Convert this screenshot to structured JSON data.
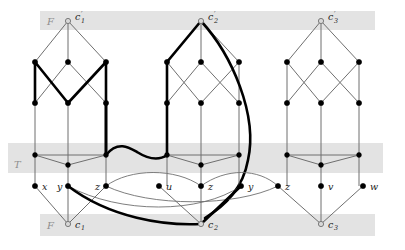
{
  "figure": {
    "width": 405,
    "height": 250,
    "colors": {
      "band": "#e3e3e3",
      "edge": "#6f6f6f",
      "edge_bold": "#000000",
      "node_solid": "#000000",
      "node_open": "#d8d8d8",
      "background": "#ffffff"
    }
  },
  "bands": [
    {
      "name": "F-top",
      "label": "F"
    },
    {
      "name": "T-middle",
      "label": "T"
    },
    {
      "name": "F-bottom",
      "label": "F"
    }
  ],
  "clause_top_nodes": [
    {
      "name": "c1-prime",
      "label": "c",
      "sub": "1",
      "prime": true
    },
    {
      "name": "c2-prime",
      "label": "c",
      "sub": "2",
      "prime": true
    },
    {
      "name": "c3-prime",
      "label": "c",
      "sub": "3",
      "prime": true
    }
  ],
  "clause_bottom_nodes": [
    {
      "name": "c1",
      "label": "c",
      "sub": "1",
      "prime": false
    },
    {
      "name": "c2",
      "label": "c",
      "sub": "2",
      "prime": false
    },
    {
      "name": "c3",
      "label": "c",
      "sub": "3",
      "prime": false
    }
  ],
  "variable_nodes": [
    {
      "name": "var-x",
      "label": "x"
    },
    {
      "name": "var-y-1",
      "label": "y"
    },
    {
      "name": "var-z-1",
      "label": "z"
    },
    {
      "name": "var-u",
      "label": "u"
    },
    {
      "name": "var-z-2",
      "label": "z"
    },
    {
      "name": "var-y-2",
      "label": "y"
    },
    {
      "name": "var-z-3",
      "label": "z"
    },
    {
      "name": "var-v",
      "label": "v"
    },
    {
      "name": "var-w",
      "label": "w"
    }
  ]
}
